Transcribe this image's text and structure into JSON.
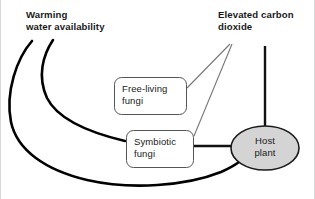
{
  "diagram": {
    "type": "concept-diagram",
    "drivers": [
      {
        "id": "warming-water-availability",
        "label": "Warming\nwater availability",
        "style": "bold-text",
        "position": "top-left"
      },
      {
        "id": "elevated-carbon-dioxide",
        "label": "Elevated carbon\ndioxide",
        "style": "bold-text",
        "position": "top-right"
      }
    ],
    "nodes": [
      {
        "id": "free-living-fungi",
        "label": "Free-living\nfungi",
        "shape": "rounded-rectangle",
        "fill": "#ffffff",
        "stroke": "#555555"
      },
      {
        "id": "symbiotic-fungi",
        "label": "Symbiotic\nfungi",
        "shape": "rounded-rectangle",
        "fill": "#ffffff",
        "stroke": "#555555"
      },
      {
        "id": "host-plant",
        "label": "Host\nplant",
        "shape": "ellipse",
        "fill": "#d4d4d4",
        "stroke": "#1a1a1a"
      }
    ],
    "edges": [
      {
        "id": "warming-to-symbiotic-fungi",
        "from": "warming-water-availability",
        "to": "symbiotic-fungi",
        "weight": "thick",
        "style": "curved"
      },
      {
        "id": "warming-to-host-plant",
        "from": "warming-water-availability",
        "to": "host-plant",
        "weight": "thick",
        "style": "curved"
      },
      {
        "id": "co2-to-free-living-fungi",
        "from": "elevated-carbon-dioxide",
        "to": "free-living-fungi",
        "weight": "thin",
        "style": "straight"
      },
      {
        "id": "co2-to-symbiotic-fungi",
        "from": "elevated-carbon-dioxide",
        "to": "symbiotic-fungi",
        "weight": "thin",
        "style": "straight"
      },
      {
        "id": "co2-to-host-plant",
        "from": "elevated-carbon-dioxide",
        "to": "host-plant",
        "weight": "thick",
        "style": "straight-vertical"
      },
      {
        "id": "symbiotic-fungi-to-host-plant",
        "from": "symbiotic-fungi",
        "to": "host-plant",
        "weight": "thick",
        "style": "straight-horizontal"
      }
    ],
    "colors": {
      "background": "#ffffff",
      "edge_thick": "#000000",
      "edge_thin": "#777777",
      "box_stroke": "#555555",
      "ellipse_fill": "#d4d4d4",
      "ellipse_stroke": "#1a1a1a",
      "text": "#1a1a1a",
      "frame_border": "#d8d8d8"
    }
  }
}
